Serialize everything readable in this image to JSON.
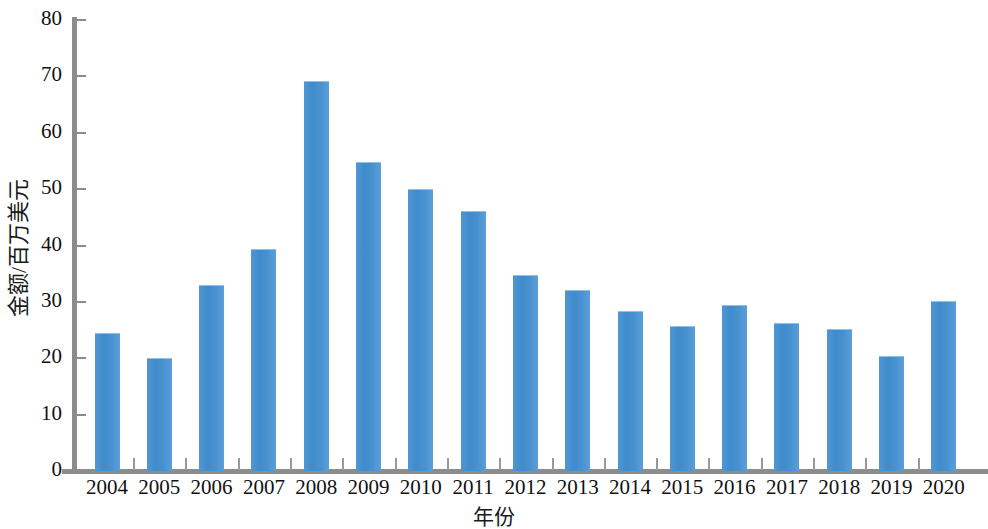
{
  "chart_data": {
    "type": "bar",
    "title": "",
    "subtitle": "",
    "xlabel": "年份",
    "ylabel": "金额/百万美元",
    "categories": [
      "2004",
      "2005",
      "2006",
      "2007",
      "2008",
      "2009",
      "2010",
      "2011",
      "2012",
      "2013",
      "2014",
      "2015",
      "2016",
      "2017",
      "2018",
      "2019",
      "2020"
    ],
    "values": [
      24.3,
      19.9,
      32.9,
      39.2,
      69.0,
      54.7,
      49.9,
      46.0,
      34.6,
      32.0,
      28.2,
      25.6,
      29.3,
      26.1,
      25.0,
      20.3,
      29.9
    ],
    "series": [
      {
        "name": "金额/百万美元",
        "values": [
          24.3,
          19.9,
          32.9,
          39.2,
          69.0,
          54.7,
          49.9,
          46.0,
          34.6,
          32.0,
          28.2,
          25.6,
          29.3,
          26.1,
          25.0,
          20.3,
          29.9
        ]
      }
    ],
    "ylim": [
      0,
      80
    ],
    "ytick_labels": [
      "80",
      "70",
      "60",
      "50",
      "40",
      "30",
      "20",
      "10",
      "0"
    ],
    "ytick_values": [
      80,
      70,
      60,
      50,
      40,
      30,
      20,
      10,
      0
    ],
    "grid": false,
    "legend": null,
    "legend_position": "none",
    "bar_color": "#4a93d2",
    "axis_color": "#8c8c8c",
    "text_color": "#111111",
    "background": "#ffffff"
  }
}
